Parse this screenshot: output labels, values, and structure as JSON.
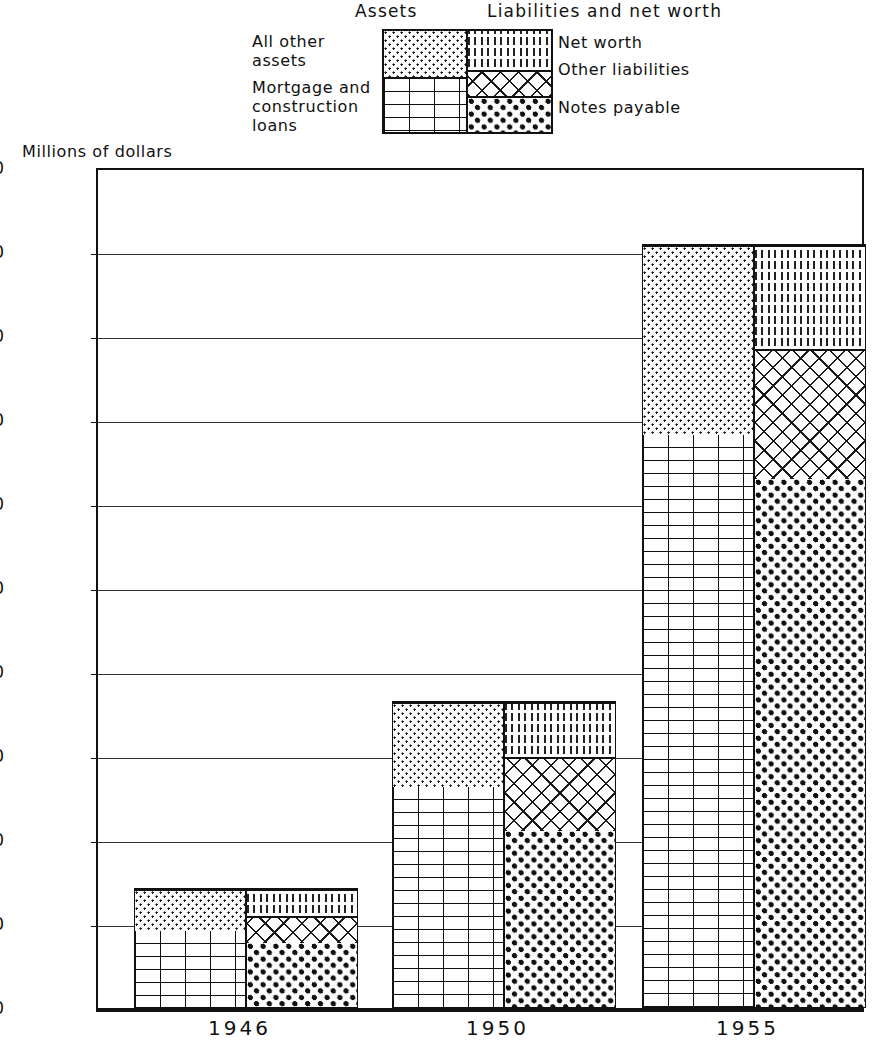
{
  "legend": {
    "assets_title": "Assets",
    "liabilities_title": "Liabilities and net worth",
    "all_other_assets": "All other\nassets",
    "mortgage_loans": "Mortgage and\nconstruction\nloans",
    "net_worth": "Net worth",
    "other_liabilities": "Other liabilities",
    "notes_payable": "Notes payable"
  },
  "axis_caption": "Millions of dollars",
  "x_labels": [
    "1946",
    "1950",
    "1955"
  ],
  "y_ticks": [
    "2,000",
    "1,800",
    "1,600",
    "1,400",
    "1,200",
    "1,000",
    "800",
    "600",
    "400",
    "200",
    "0"
  ],
  "chart_data": {
    "type": "bar",
    "title": "",
    "subtitle": "",
    "xlabel": "",
    "ylabel": "Millions of dollars",
    "ylim": [
      0,
      2000
    ],
    "ytick_values": [
      0,
      200,
      400,
      600,
      800,
      1000,
      1200,
      1400,
      1600,
      1800,
      2000
    ],
    "grid": true,
    "stacked": true,
    "paired": true,
    "legend_position": "top",
    "categories": [
      "1946",
      "1950",
      "1955"
    ],
    "pairs": [
      {
        "name": "Assets",
        "series": [
          {
            "name": "Mortgage and construction loans",
            "values": [
              185,
              528,
              1365
            ],
            "pattern": "brick"
          },
          {
            "name": "All other assets",
            "values": [
              100,
              202,
              455
            ],
            "pattern": "fine-dots"
          }
        ],
        "totals": [
          285,
          730,
          1820
        ]
      },
      {
        "name": "Liabilities and net worth",
        "series": [
          {
            "name": "Notes payable",
            "values": [
              155,
              423,
              1260
            ],
            "pattern": "bold-dots"
          },
          {
            "name": "Other liabilities",
            "values": [
              65,
              177,
              310
            ],
            "pattern": "crosshatch"
          },
          {
            "name": "Net worth",
            "values": [
              65,
              130,
              250
            ],
            "pattern": "vertical-dash"
          }
        ],
        "totals": [
          285,
          730,
          1820
        ]
      }
    ]
  }
}
